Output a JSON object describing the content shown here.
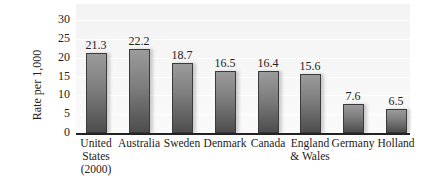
{
  "chart_data": {
    "type": "bar",
    "title": "",
    "xlabel": "",
    "ylabel": "Rate per 1,000",
    "ylim": [
      0,
      30
    ],
    "yticks": [
      0,
      5,
      10,
      15,
      20,
      25,
      30
    ],
    "grid": true,
    "legend": null,
    "categories": [
      "United States (2000)",
      "Australia",
      "Sweden",
      "Denmark",
      "Canada",
      "England & Wales",
      "Germany",
      "Holland"
    ],
    "category_labels_display": [
      "United\nStates\n(2000)",
      "Australia",
      "Sweden",
      "Denmark",
      "Canada",
      "England\n& Wales",
      "Germany",
      "Holland"
    ],
    "values": [
      21.3,
      22.2,
      18.7,
      16.5,
      16.4,
      15.6,
      7.6,
      6.5
    ],
    "value_labels": [
      "21.3",
      "22.2",
      "18.7",
      "16.5",
      "16.4",
      "15.6",
      "7.6",
      "6.5"
    ],
    "bar_color": "#707070"
  }
}
